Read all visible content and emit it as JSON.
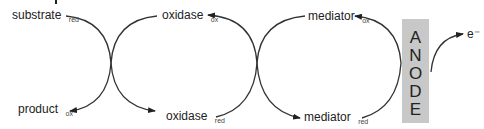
{
  "diagram": {
    "type": "mediated electron transfer cycle",
    "colors": {
      "line": "#333333",
      "text": "#222222",
      "anode_fill": "#c8c8c8"
    },
    "labels": {
      "substrate": {
        "main": "substrate",
        "sub": "red"
      },
      "product": {
        "main": "product",
        "sub": "ox"
      },
      "oxidase_ox": {
        "main": "oxidase",
        "sub": "ox"
      },
      "oxidase_red": {
        "main": "oxidase",
        "sub": "red"
      },
      "mediator_ox": {
        "main": "mediator",
        "sub": "ox"
      },
      "mediator_red": {
        "main": "mediator",
        "sub": "red"
      },
      "electron": "e⁻"
    },
    "anode": {
      "letters": [
        "A",
        "N",
        "O",
        "D",
        "E"
      ]
    }
  }
}
